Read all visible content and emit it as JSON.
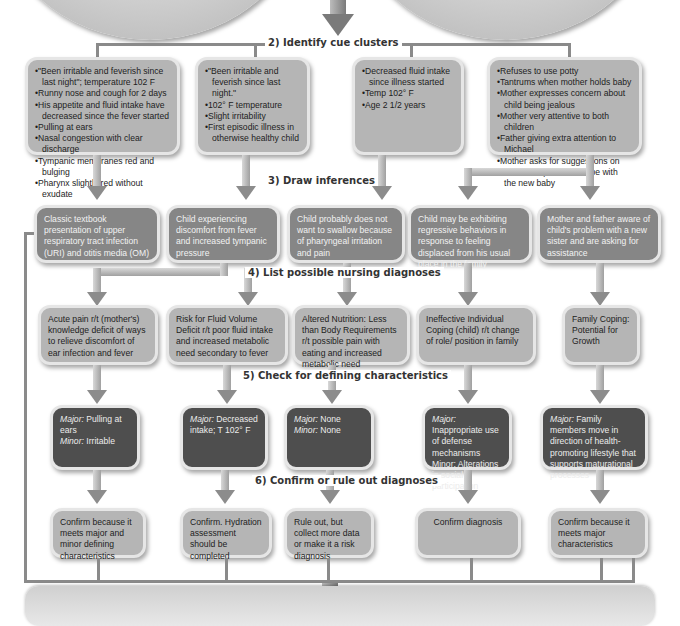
{
  "steps": {
    "s2": "2) Identify cue clusters",
    "s3": "3) Draw inferences",
    "s4": "4) List possible nursing diagnoses",
    "s5": "5) Check for defining characteristics",
    "s6": "6) Confirm or rule out diagnoses"
  },
  "cue_clusters": [
    {
      "items": [
        "\"Been irritable and feverish since last night\"; temperature 102 F",
        "Runny nose and cough for 2 days",
        "His appetite and fluid intake have decreased since the fever started",
        "Pulling at ears",
        "Nasal congestion with clear discharge",
        "Tympanic membranes red and bulging",
        "Pharynx slightly red without exudate"
      ]
    },
    {
      "items": [
        "\"Been irritable and feverish since last night.\"",
        "102° F  temperature",
        "Slight irritability",
        "First episodic illness in otherwise healthy child"
      ]
    },
    {
      "items": [
        "Decreased fluid intake since illness started",
        "Temp 102° F",
        "Age 2 1/2 years"
      ]
    },
    {
      "items": [
        "Refuses to use potty",
        "Tantrums when mother holds baby",
        "Mother expresses concern about child being jealous",
        "Mother very attentive to both children",
        "Father giving extra attention to Michael",
        "Mother asks for suggestions on how to help her son cope with the new baby"
      ]
    }
  ],
  "inferences": [
    "Classic textbook presentation of upper respiratory tract infection (URI) and otitis media (OM)",
    "Child experiencing discomfort from fever and increased tympanic pressure",
    "Child probably does not want to swallow because of pharyngeal irritation and pain",
    "Child may be exhibiting regressive behaviors in response to feeling displaced from his usual place in the family",
    "Mother and father aware of child's problem with a new sister and are asking for assistance"
  ],
  "diagnoses": [
    "Acute pain r/t (mother's) knowledge deficit of ways to relieve discomfort of ear infection and fever",
    "Risk for Fluid Volume Deficit r/t poor fluid intake and increased metabolic need secondary to fever",
    "Altered Nutrition: Less than Body Requirements r/t possible pain with eating and increased metabolic need",
    "Ineffective Individual Coping (child) r/t change of role/ position in family",
    "Family Coping: Potential for Growth"
  ],
  "characteristics": [
    {
      "major_label": "Major:",
      "major": "Pulling at ears",
      "minor_label": "Minor:",
      "minor": "Irritable"
    },
    {
      "major_label": "Major:",
      "major": "Decreased intake; T 102° F",
      "minor_label": "",
      "minor": ""
    },
    {
      "major_label": "Major:",
      "major": "None",
      "minor_label": "Minor:",
      "minor": "None"
    },
    {
      "major_label": "Major:",
      "major": "Inappropriate use of defense mechanisms",
      "minor_label": "Minor:",
      "minor": "Alterations in social participation"
    },
    {
      "major_label": "Major:",
      "major": "Family members move in direction of health-promoting lifestyle that supports maturational processes",
      "minor_label": "",
      "minor": ""
    }
  ],
  "outcomes": [
    "Confirm because it meets major and minor defining characteristics",
    "Confirm. Hydration assessment should be completed",
    "Rule out, but collect more data or make it a risk diagnosis",
    "Confirm diagnosis",
    "Confirm because it meets major characteristics"
  ],
  "colors": {
    "light_box": "#b5b5b5",
    "mid_box": "#868686",
    "dark_box": "#4e4e4e",
    "connector": "#8a8a8a"
  }
}
